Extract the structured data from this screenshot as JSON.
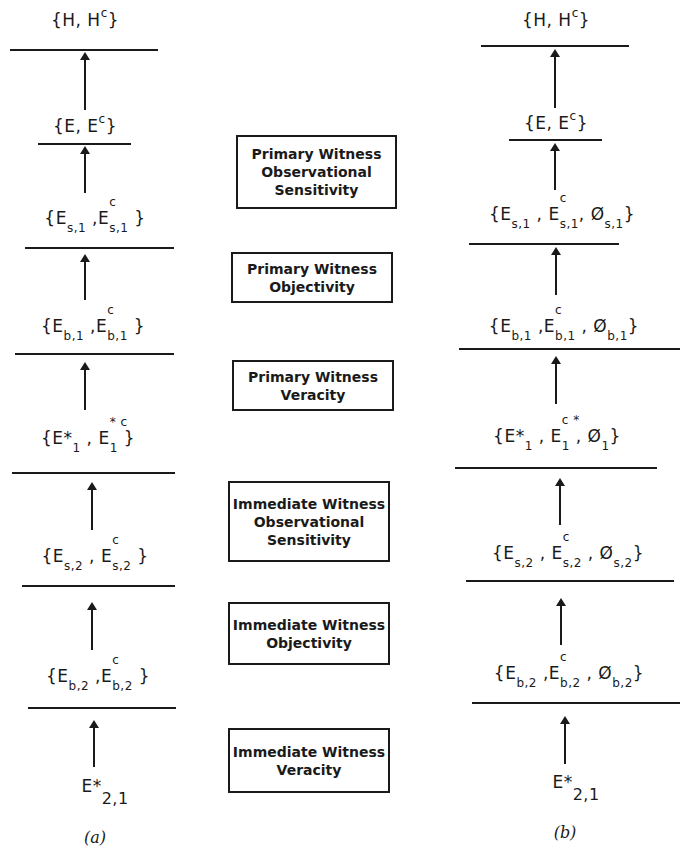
{
  "panels": {
    "a": {
      "caption": "(a)",
      "nodes": {
        "h": {
          "open": "{H, H",
          "sup": "c",
          "close": "}"
        },
        "e": {
          "open": "{E, E",
          "sup": "c",
          "close": "}"
        },
        "s1": {
          "e": "E",
          "sub1": "s,1",
          "sep": " ,E",
          "sub2": "s,1",
          "sup2": "c",
          "close": " }",
          "open": "{"
        },
        "b1": {
          "open": "{",
          "e": "E",
          "sub1": "b,1",
          "sep": " ,E",
          "sub2": "b,1",
          "sup2": "c",
          "close": " }"
        },
        "star1": {
          "open": "{",
          "e": "E*",
          "sub1": "1",
          "sep": " , E",
          "sub2": "1",
          "sup2": "* c",
          "close": " }"
        },
        "s2": {
          "open": "{",
          "e": "E",
          "sub1": "s,2",
          "sep": " , E",
          "sub2": "s,2",
          "sup2": "c",
          "close": " }"
        },
        "b2": {
          "open": "{",
          "e": "E",
          "sub1": "b,2",
          "sep": " ,E",
          "sub2": "b,2",
          "sup2": "c",
          "close": " }"
        },
        "root": {
          "e": "E*",
          "sub": "2,1"
        }
      }
    },
    "b": {
      "caption": "(b)",
      "nodes": {
        "h": {
          "open": "{H, H",
          "sup": "c",
          "close": "}"
        },
        "e": {
          "open": "{E, E",
          "sup": "c",
          "close": "}"
        },
        "s1": {
          "open": "{",
          "e": "E",
          "sub1": "s,1",
          "sep": " , E",
          "sub2": "s,1",
          "sup2": "c",
          "sep2": ",  Ø",
          "sub3": "s,1",
          "close": "}"
        },
        "b1": {
          "open": "{",
          "e": "E",
          "sub1": "b,1",
          "sep": " ,E",
          "sub2": "b,1",
          "sup2": "c",
          "sep2": " , Ø",
          "sub3": "b,1",
          "close": "}"
        },
        "star1": {
          "open": "{",
          "e": "E*",
          "sub1": "1",
          "sep": " , E",
          "sub2": "1",
          "sup2": "c *",
          "sep2": " , Ø",
          "sub3": "1",
          "close": "}"
        },
        "s2": {
          "open": "{",
          "e": "E",
          "sub1": "s,2",
          "sep": " , E",
          "sub2": "s,2",
          "sup2": "c",
          "sep2": " , Ø",
          "sub3": "s,2",
          "close": "}"
        },
        "b2": {
          "open": "{",
          "e": "E",
          "sub1": "b,2",
          "sep": " ,E",
          "sub2": "b,2",
          "sup2": "c",
          "sep2": " , Ø",
          "sub3": "b,2",
          "close": "}"
        },
        "root": {
          "e": "E*",
          "sub": "2,1"
        }
      }
    }
  },
  "boxes": [
    {
      "lines": [
        "Primary Witness",
        "Observational",
        "Sensitivity"
      ]
    },
    {
      "lines": [
        "Primary Witness",
        "Objectivity"
      ]
    },
    {
      "lines": [
        "Primary Witness",
        "Veracity"
      ]
    },
    {
      "lines": [
        "Immediate Witness",
        "Observational",
        "Sensitivity"
      ]
    },
    {
      "lines": [
        "Immediate Witness",
        "Objectivity"
      ]
    },
    {
      "lines": [
        "Immediate Witness",
        "Veracity"
      ]
    }
  ]
}
